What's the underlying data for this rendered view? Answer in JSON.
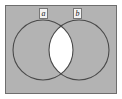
{
  "figure": {
    "type": "venn-diagram",
    "title": "",
    "caption": "",
    "universe": {
      "name": "universal-set-rectangle",
      "fill_color": "#b3b3b3",
      "border_color": "#6e6e6e",
      "x": 5,
      "y": 5,
      "width": 112,
      "height": 89
    },
    "sets": [
      {
        "id": "a",
        "label": "a",
        "cx": 43,
        "cy": 50,
        "r": 30,
        "stroke_color": "#4a4a4a",
        "fill_color": "#b3b3b3"
      },
      {
        "id": "b",
        "label": "b",
        "cx": 79,
        "cy": 50,
        "r": 30,
        "stroke_color": "#4a4a4a",
        "fill_color": "#b3b3b3"
      }
    ],
    "shaded_region": {
      "name": "intersection-lens",
      "description": "intersection of a and b",
      "fill_color": "#ffffff"
    },
    "background_color": "#ffffff"
  }
}
